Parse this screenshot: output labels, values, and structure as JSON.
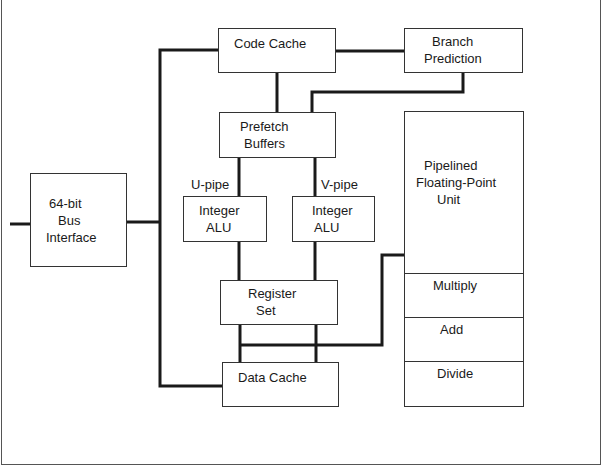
{
  "diagram": {
    "type": "block-diagram",
    "blocks": {
      "code_cache": {
        "label": "Code Cache"
      },
      "branch_prediction": {
        "line1": "Branch",
        "line2": "Prediction"
      },
      "prefetch_buffers": {
        "line1": "Prefetch",
        "line2": "Buffers"
      },
      "bus_interface": {
        "line1": "64-bit",
        "line2": "Bus",
        "line3": "Interface"
      },
      "integer_alu_u": {
        "line1": "Integer",
        "line2": "ALU"
      },
      "integer_alu_v": {
        "line1": "Integer",
        "line2": "ALU"
      },
      "register_set": {
        "line1": "Register",
        "line2": "Set"
      },
      "data_cache": {
        "label": "Data Cache"
      },
      "fpu": {
        "line1": "Pipelined",
        "line2": "Floating-Point",
        "line3": "Unit",
        "sections": [
          "Multiply",
          "Add",
          "Divide"
        ]
      }
    },
    "pipe_labels": {
      "u_pipe": "U-pipe",
      "v_pipe": "V-pipe"
    },
    "colors": {
      "line": "#1a1a1a",
      "box_border": "#333333",
      "background": "#ffffff"
    }
  }
}
